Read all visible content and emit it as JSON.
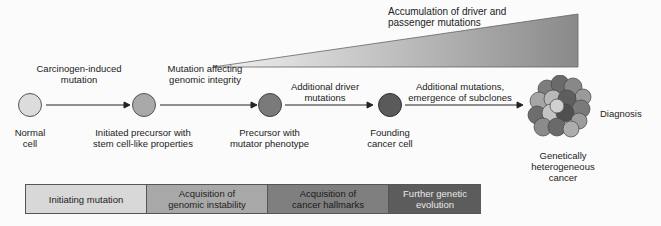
{
  "wedge": {
    "label_line1": "Accumulation of driver and",
    "label_line2": "passenger mutations"
  },
  "cells": [
    {
      "label_line1": "Normal",
      "label_line2": "cell",
      "color": "#dcdcdc"
    },
    {
      "label_line1": "Initiated precursor with",
      "label_line2": "stem cell-like properties",
      "color": "#a9a9a9"
    },
    {
      "label_line1": "Precursor with",
      "label_line2": "mutator phenotype",
      "color": "#7a7a7a"
    },
    {
      "label_line1": "Founding",
      "label_line2": "cancer cell",
      "color": "#5a5a5a"
    }
  ],
  "arrows": [
    {
      "label_line1": "Carcinogen-induced",
      "label_line2": "mutation"
    },
    {
      "label_line1": "Mutation affecting",
      "label_line2": "genomic integrity"
    },
    {
      "label_line1": "Additional driver",
      "label_line2": "mutations"
    },
    {
      "label_line1": "Additional mutations,",
      "label_line2": "emergence of subclones"
    }
  ],
  "tumor": {
    "label_line1": "Genetically",
    "label_line2": "heterogeneous",
    "label_line3": "cancer",
    "diagnosis_label": "Diagnosis"
  },
  "stages": [
    {
      "line1": "Initiating mutation",
      "line2": "",
      "color": "#d8d8d8"
    },
    {
      "line1": "Acquisition of",
      "line2": "genomic instability",
      "color": "#a8a8a8"
    },
    {
      "line1": "Acquisition of",
      "line2": "cancer hallmarks",
      "color": "#7f7f7f"
    },
    {
      "line1": "Further genetic",
      "line2": "evolution",
      "color": "#5c5c5c"
    }
  ]
}
